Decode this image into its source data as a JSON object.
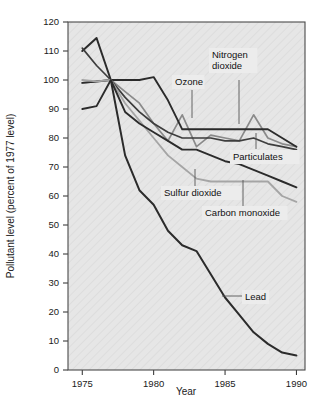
{
  "chart_data": {
    "type": "line",
    "title": "",
    "xlabel": "Year",
    "ylabel": "Pollutant level (percent of 1977 level)",
    "xlim": [
      1974,
      1990.6
    ],
    "ylim": [
      0,
      120
    ],
    "xticks": [
      1975,
      1980,
      1985,
      1990
    ],
    "xtick_labels": [
      "1975",
      "1980",
      "1985",
      "1990"
    ],
    "yticks": [
      0,
      10,
      20,
      30,
      40,
      50,
      60,
      70,
      80,
      90,
      100,
      110,
      120
    ],
    "ytick_labels": [
      "0",
      "10",
      "20",
      "30",
      "40",
      "50",
      "60",
      "70",
      "80",
      "90",
      "100",
      "110",
      "120"
    ],
    "grid": false,
    "legend": "inline-annotations",
    "x": [
      1975,
      1976,
      1977,
      1978,
      1979,
      1980,
      1981,
      1982,
      1983,
      1984,
      1985,
      1986,
      1987,
      1988,
      1989,
      1990
    ],
    "series": [
      {
        "name": "Lead",
        "color": "#2b2b2b",
        "width": 2.0,
        "values": [
          110,
          114.5,
          100,
          74,
          62,
          57,
          48,
          43,
          41,
          33,
          25,
          19,
          13,
          9,
          6,
          5
        ]
      },
      {
        "name": "Ozone",
        "color": "#8a8a8a",
        "width": 1.7,
        "values": [
          99,
          99.5,
          100,
          96,
          92,
          85,
          79,
          88,
          77,
          81,
          80,
          79,
          88,
          80,
          78,
          77
        ]
      },
      {
        "name": "Nitrogen dioxide",
        "color": "#2b2b2b",
        "width": 1.9,
        "values": [
          99,
          99.5,
          100,
          100,
          100,
          101,
          93,
          83,
          83,
          83,
          83,
          83,
          83,
          83,
          80,
          77
        ]
      },
      {
        "name": "Particulates",
        "color": "#3d3d3d",
        "width": 1.7,
        "values": [
          111,
          105,
          100,
          94,
          89,
          85,
          82,
          80,
          80,
          80,
          79,
          79,
          80,
          78,
          77,
          76
        ]
      },
      {
        "name": "Sulfur dioxide",
        "color": "#a5a5a5",
        "width": 1.8,
        "values": [
          100,
          99.5,
          100,
          92,
          86,
          80,
          74,
          70,
          66,
          65,
          65,
          65,
          65,
          65,
          60,
          58
        ]
      },
      {
        "name": "Carbon monoxide",
        "color": "#2b2b2b",
        "width": 1.9,
        "values": [
          90,
          91,
          100,
          89,
          85,
          82,
          79,
          76,
          76,
          74,
          72,
          71,
          69,
          67,
          65,
          63
        ]
      }
    ],
    "annotations": [
      {
        "text": "Ozone",
        "text2": "",
        "tx": 175,
        "ty": 85,
        "lx": 192,
        "ly": 90,
        "lx2": 192,
        "ly2": 118
      },
      {
        "text": "Nitrogen",
        "text2": "dioxide",
        "tx": 212,
        "ty": 58,
        "lx": 239,
        "ly": 80,
        "lx2": 239,
        "ly2": 124
      },
      {
        "text": "Particulates",
        "text2": "",
        "tx": 233,
        "ty": 160,
        "lx": 256,
        "ly": 149,
        "lx2": 256,
        "ly2": 133
      },
      {
        "text": "Sulfur dioxide",
        "text2": "",
        "tx": 164,
        "ty": 196,
        "lx": 195,
        "ly": 186,
        "lx2": 195,
        "ly2": 169
      },
      {
        "text": "Carbon monoxide",
        "text2": "",
        "tx": 205,
        "ty": 216,
        "lx": 243,
        "ly": 206,
        "lx2": 243,
        "ly2": 180
      },
      {
        "text": "Lead",
        "text2": "",
        "tx": 245,
        "ty": 300,
        "lx": 242,
        "ly": 296,
        "lx2": 222,
        "ly2": 296
      }
    ]
  }
}
